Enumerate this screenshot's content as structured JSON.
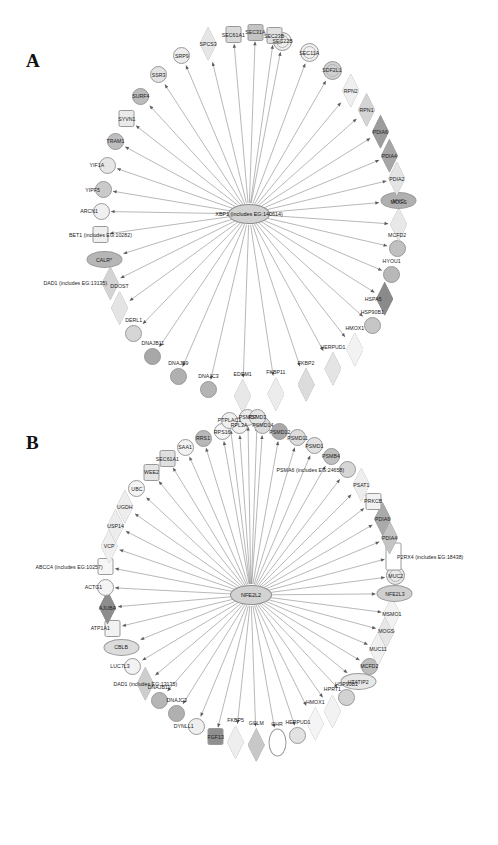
{
  "figure": {
    "panels": [
      {
        "id": "A",
        "label": "A",
        "hub": {
          "name": "XBP1 (includes EG:140614)",
          "shape": "oval",
          "fill": "#c9c9c9"
        },
        "nodes": [
          {
            "label": "EDEM1",
            "shape": "diamond",
            "fill": "#e8e8e8",
            "angle": 268.0,
            "r": 182,
            "lblpos": "above"
          },
          {
            "label": "FKBP11",
            "shape": "diamond",
            "fill": "#ececec",
            "angle": 278.5,
            "r": 182,
            "lblpos": "above"
          },
          {
            "label": "FKBP2",
            "shape": "diamond",
            "fill": "#dcdcdc",
            "angle": 288.5,
            "r": 180,
            "lblpos": "above"
          },
          {
            "label": "DNAJC3",
            "shape": "circle",
            "fill": "#b4b4b4",
            "angle": 257.0,
            "r": 180,
            "lblpos": "above"
          },
          {
            "label": "DNAJB9",
            "shape": "circle",
            "fill": "#b0b0b0",
            "angle": 246.5,
            "r": 177,
            "lblpos": "above"
          },
          {
            "label": "HERPUD1",
            "shape": "diamond",
            "fill": "#e4e4e4",
            "angle": 298.5,
            "r": 176,
            "lblpos": "above"
          },
          {
            "label": "HMOX1",
            "shape": "diamond",
            "fill": "#f2f2f2",
            "angle": 308.0,
            "r": 172,
            "lblpos": "above"
          },
          {
            "label": "DNAJB11",
            "shape": "circle",
            "fill": "#a8a8a8",
            "angle": 236.0,
            "r": 172,
            "lblpos": "above"
          },
          {
            "label": "DERL1",
            "shape": "circle",
            "fill": "#d6d6d6",
            "angle": 226.0,
            "r": 166,
            "lblpos": "above"
          },
          {
            "label": "HSP90B1",
            "shape": "circle",
            "fill": "#c6c6c6",
            "angle": 318.0,
            "r": 166,
            "lblpos": "above"
          },
          {
            "label": "DDOST",
            "shape": "diamond",
            "fill": "#e4e4e4",
            "angle": 216.0,
            "r": 160,
            "lblpos": "above"
          },
          {
            "label": "HSPA5",
            "shape": "diamond",
            "fill": "#8a8a8a",
            "angle": 328.0,
            "r": 160,
            "lblpos": "left"
          },
          {
            "label": "DAD1 (includes EG:13135)",
            "shape": "diamond",
            "fill": "#d4d4d4",
            "angle": 206.5,
            "r": 155,
            "lblpos": "left"
          },
          {
            "label": "HYOU1",
            "shape": "circle",
            "fill": "#b8b8b8",
            "angle": 337.0,
            "r": 155,
            "lblpos": "above"
          },
          {
            "label": "CALR*",
            "shape": "oval",
            "fill": "#b6b6b6",
            "angle": 197.5,
            "r": 152,
            "lblpos": "center"
          },
          {
            "label": "MCFD2",
            "shape": "circle",
            "fill": "#c0c0c0",
            "angle": 347.0,
            "r": 152,
            "lblpos": "above"
          },
          {
            "label": "BET1 (includes EG:10282)",
            "shape": "rect",
            "fill": "#efefef",
            "angle": 188.0,
            "r": 150,
            "lblpos": "center"
          },
          {
            "label": "MOGS",
            "shape": "diamond",
            "fill": "#e8e8e8",
            "angle": 356.0,
            "r": 150,
            "lblpos": "above"
          },
          {
            "label": "ARCN1",
            "shape": "circle",
            "fill": "#f0f0f0",
            "angle": 179.0,
            "r": 148,
            "lblpos": "left"
          },
          {
            "label": "MYC",
            "shape": "oval",
            "fill": "#b0b0b0",
            "angle": 5.0,
            "r": 150,
            "lblpos": "center"
          },
          {
            "label": "YIPF5",
            "shape": "circle",
            "fill": "#cacaca",
            "angle": 170.5,
            "r": 148,
            "lblpos": "left"
          },
          {
            "label": "PDIA2",
            "shape": "diamond",
            "fill": "#e4e4e4",
            "angle": 13.5,
            "r": 152,
            "lblpos": "center"
          },
          {
            "label": "YIF1A",
            "shape": "circle",
            "fill": "#e6e6e6",
            "angle": 161.0,
            "r": 150,
            "lblpos": "left"
          },
          {
            "label": "PDIA4",
            "shape": "diamond",
            "fill": "#a6a6a6",
            "angle": 22.5,
            "r": 152,
            "lblpos": "center"
          },
          {
            "label": "TRAM1",
            "shape": "circle",
            "fill": "#bebebe",
            "angle": 151.5,
            "r": 152,
            "lblpos": "center"
          },
          {
            "label": "PDIA6",
            "shape": "diamond",
            "fill": "#9c9c9c",
            "angle": 32.0,
            "r": 155,
            "lblpos": "center"
          },
          {
            "label": "SYVN1",
            "shape": "rect",
            "fill": "#eaeaea",
            "angle": 142.0,
            "r": 155,
            "lblpos": "center"
          },
          {
            "label": "RPN1",
            "shape": "diamond",
            "fill": "#d4d4d4",
            "angle": 41.5,
            "r": 157,
            "lblpos": "center"
          },
          {
            "label": "SURF4",
            "shape": "circle",
            "fill": "#bcbcbc",
            "angle": 132.5,
            "r": 160,
            "lblpos": "center"
          },
          {
            "label": "RPN2",
            "shape": "diamond",
            "fill": "#efefef",
            "angle": 50.5,
            "r": 160,
            "lblpos": "center"
          },
          {
            "label": "SSR3",
            "shape": "circle",
            "fill": "#e3e3e3",
            "angle": 123.0,
            "r": 166,
            "lblpos": "center"
          },
          {
            "label": "SDF2L1",
            "shape": "ring",
            "fill": "#d0d0d0",
            "angle": 60.0,
            "r": 166,
            "lblpos": "center"
          },
          {
            "label": "SRP9",
            "shape": "circle",
            "fill": "#ededed",
            "angle": 113.0,
            "r": 172,
            "lblpos": "center"
          },
          {
            "label": "SEC11A",
            "shape": "ring",
            "fill": "#efefef",
            "angle": 69.5,
            "r": 172,
            "lblpos": "center"
          },
          {
            "label": "SPCS3",
            "shape": "diamond",
            "fill": "#e6e6e6",
            "angle": 103.5,
            "r": 175,
            "lblpos": "center"
          },
          {
            "label": "SEC22B",
            "shape": "ring",
            "fill": "#ededed",
            "angle": 79.0,
            "r": 176,
            "lblpos": "center"
          },
          {
            "label": "SEC61A1",
            "shape": "rect",
            "fill": "#d9d9d9",
            "angle": 95.0,
            "r": 180,
            "lblpos": "center"
          },
          {
            "label": "SEC31A",
            "shape": "rect",
            "fill": "#c4c4c4",
            "angle": 88.0,
            "r": 182,
            "lblpos": "center"
          },
          {
            "label": "SEC23B",
            "shape": "rect",
            "fill": "#e0e0e0",
            "angle": 82.0,
            "r": 180,
            "lblpos": "center"
          }
        ]
      },
      {
        "id": "B",
        "label": "B",
        "hub": {
          "name": "NFE2L2",
          "shape": "oval",
          "fill": "#c9c9c9"
        },
        "nodes": [
          {
            "label": "GCLM",
            "shape": "diamond",
            "fill": "#c8c8c8",
            "angle": 272.0,
            "r": 150,
            "lblpos": "above"
          },
          {
            "label": "GHR",
            "shape": "vell",
            "fill": "#ffffff",
            "angle": 280.0,
            "r": 150,
            "lblpos": "above"
          },
          {
            "label": "FKBP5",
            "shape": "diamond",
            "fill": "#eeeeee",
            "angle": 264.0,
            "r": 148,
            "lblpos": "above"
          },
          {
            "label": "HERPUD1",
            "shape": "circle",
            "fill": "#e2e2e2",
            "angle": 288.5,
            "r": 148,
            "lblpos": "above"
          },
          {
            "label": "FGF13",
            "shape": "rect",
            "fill": "#8f8f8f",
            "angle": 256.0,
            "r": 146,
            "lblpos": "center"
          },
          {
            "label": "HMOX1",
            "shape": "diamond",
            "fill": "#f4f4f4",
            "angle": 296.5,
            "r": 144,
            "lblpos": "above"
          },
          {
            "label": "DYNLL1",
            "shape": "circle",
            "fill": "#efefef",
            "angle": 247.5,
            "r": 142,
            "lblpos": "left"
          },
          {
            "label": "HPRT1",
            "shape": "diamond",
            "fill": "#f2f2f2",
            "angle": 305.0,
            "r": 142,
            "lblpos": "above"
          },
          {
            "label": "DNAJC3",
            "shape": "circle",
            "fill": "#b0b0b0",
            "angle": 238.0,
            "r": 140,
            "lblpos": "above"
          },
          {
            "label": "HSP90B1",
            "shape": "circle",
            "fill": "#d2d2d2",
            "angle": 313.0,
            "r": 140,
            "lblpos": "above"
          },
          {
            "label": "DNAJB11",
            "shape": "circle",
            "fill": "#b6b6b6",
            "angle": 229.0,
            "r": 140,
            "lblpos": "above"
          },
          {
            "label": "HTATIP2",
            "shape": "oval",
            "fill": "#e7e7e7",
            "angle": 321.0,
            "r": 138,
            "lblpos": "center"
          },
          {
            "label": "DAD1 (includes EG:13135)",
            "shape": "diamond",
            "fill": "#cecece",
            "angle": 220.0,
            "r": 138,
            "lblpos": "center"
          },
          {
            "label": "MCFD2",
            "shape": "circle",
            "fill": "#bdbdbd",
            "angle": 329.0,
            "r": 138,
            "lblpos": "center"
          },
          {
            "label": "LUC7L3",
            "shape": "circle",
            "fill": "#f2f2f2",
            "angle": 211.0,
            "r": 138,
            "lblpos": "left"
          },
          {
            "label": "MUC11",
            "shape": "diamond",
            "fill": "#f0f0f0",
            "angle": 337.0,
            "r": 138,
            "lblpos": "center"
          },
          {
            "label": "CBLB",
            "shape": "oval",
            "fill": "#dcdcdc",
            "angle": 202.0,
            "r": 140,
            "lblpos": "center"
          },
          {
            "label": "MOGS",
            "shape": "diamond",
            "fill": "#e6e6e6",
            "angle": 345.0,
            "r": 140,
            "lblpos": "center"
          },
          {
            "label": "ATP1A1",
            "shape": "rect",
            "fill": "#f2f2f2",
            "angle": 193.5,
            "r": 142,
            "lblpos": "left"
          },
          {
            "label": "MSMO1",
            "shape": "diamond",
            "fill": "#f2f2f2",
            "angle": 352.5,
            "r": 142,
            "lblpos": "center"
          },
          {
            "label": "AJUBA",
            "shape": "diamond",
            "fill": "#8d8d8d",
            "angle": 185.0,
            "r": 144,
            "lblpos": "center"
          },
          {
            "label": "NFE2L3",
            "shape": "oval",
            "fill": "#d0d0d0",
            "angle": 0.5,
            "r": 144,
            "lblpos": "center"
          },
          {
            "label": "ACTG1",
            "shape": "circle",
            "fill": "#f4f4f4",
            "angle": 177.0,
            "r": 146,
            "lblpos": "left"
          },
          {
            "label": "MUC2",
            "shape": "ring",
            "fill": "#e9e9e9",
            "angle": 7.5,
            "r": 146,
            "lblpos": "center"
          },
          {
            "label": "ABCC4 (includes EG:10257)",
            "shape": "rect",
            "fill": "#f6f6f6",
            "angle": 169.0,
            "r": 148,
            "lblpos": "left"
          },
          {
            "label": "P2RX4 (includes EG:18438)",
            "shape": "rect-tall",
            "fill": "#ffffff",
            "angle": 15.0,
            "r": 148,
            "lblpos": "right"
          },
          {
            "label": "VCP",
            "shape": "diamond",
            "fill": "#efefef",
            "angle": 161.0,
            "r": 150,
            "lblpos": "center"
          },
          {
            "label": "PDIA4",
            "shape": "diamond",
            "fill": "#c4c4c4",
            "angle": 22.5,
            "r": 150,
            "lblpos": "center"
          },
          {
            "label": "USP14",
            "shape": "diamond",
            "fill": "#ececec",
            "angle": 153.0,
            "r": 152,
            "lblpos": "center"
          },
          {
            "label": "PDIA6",
            "shape": "diamond",
            "fill": "#aaaaaa",
            "angle": 30.0,
            "r": 152,
            "lblpos": "center"
          },
          {
            "label": "UGDH",
            "shape": "diamond",
            "fill": "#ededed",
            "angle": 145.0,
            "r": 154,
            "lblpos": "center"
          },
          {
            "label": "PRKCB",
            "shape": "rect",
            "fill": "#f2f2f2",
            "angle": 37.5,
            "r": 154,
            "lblpos": "center"
          },
          {
            "label": "UBC",
            "shape": "circle",
            "fill": "#f4f4f4",
            "angle": 137.0,
            "r": 156,
            "lblpos": "center"
          },
          {
            "label": "PSAT1",
            "shape": "diamond",
            "fill": "#eeeeee",
            "angle": 45.0,
            "r": 156,
            "lblpos": "center"
          },
          {
            "label": "WEE2",
            "shape": "rect",
            "fill": "#e4e4e4",
            "angle": 129.0,
            "r": 158,
            "lblpos": "center"
          },
          {
            "label": "PSMA6 (includes EG:24658)",
            "shape": "circle",
            "fill": "#d6d6d6",
            "angle": 52.5,
            "r": 158,
            "lblpos": "left"
          },
          {
            "label": "SEC61A1",
            "shape": "rect",
            "fill": "#e0e0e0",
            "angle": 121.5,
            "r": 160,
            "lblpos": "center"
          },
          {
            "label": "PSMB4",
            "shape": "circle",
            "fill": "#bfbfbf",
            "angle": 60.0,
            "r": 160,
            "lblpos": "center"
          },
          {
            "label": "SAA1",
            "shape": "circle",
            "fill": "#f2f2f2",
            "angle": 114.0,
            "r": 162,
            "lblpos": "center"
          },
          {
            "label": "PSMD1",
            "shape": "circle",
            "fill": "#e2e2e2",
            "angle": 67.0,
            "r": 162,
            "lblpos": "center"
          },
          {
            "label": "RRS1",
            "shape": "circle",
            "fill": "#b8b8b8",
            "angle": 107.0,
            "r": 164,
            "lblpos": "center"
          },
          {
            "label": "PSMD11",
            "shape": "circle",
            "fill": "#dcdcdc",
            "angle": 73.5,
            "r": 164,
            "lblpos": "center"
          },
          {
            "label": "RPS16",
            "shape": "circle",
            "fill": "#f4f4f4",
            "angle": 100.0,
            "r": 166,
            "lblpos": "center"
          },
          {
            "label": "PSMD12",
            "shape": "circle",
            "fill": "#a8a8a8",
            "angle": 80.0,
            "r": 166,
            "lblpos": "center"
          },
          {
            "label": "RPL3A",
            "shape": "circle",
            "fill": "#f0f0f0",
            "angle": 94.0,
            "r": 170,
            "lblpos": "center"
          },
          {
            "label": "PSMD14",
            "shape": "circle",
            "fill": "#dadada",
            "angle": 86.0,
            "r": 170,
            "lblpos": "center"
          },
          {
            "label": "PTPLAC1",
            "shape": "circle",
            "fill": "#efefef",
            "angle": 97.0,
            "r": 176,
            "lblpos": "center"
          },
          {
            "label": "PSMD7",
            "shape": "circle",
            "fill": "#ececec",
            "angle": 91.0,
            "r": 178,
            "lblpos": "center"
          },
          {
            "label": "PSMD3",
            "shape": "circle",
            "fill": "#e4e4e4",
            "angle": 88.0,
            "r": 178,
            "lblpos": "center"
          }
        ]
      }
    ]
  }
}
